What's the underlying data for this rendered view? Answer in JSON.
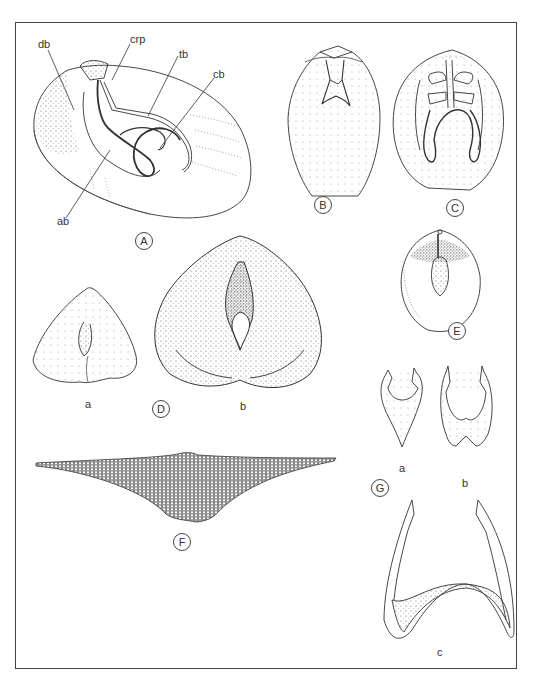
{
  "plate": {
    "figures": [
      {
        "id": "A",
        "label": "A",
        "annotations": [
          "db",
          "crp",
          "tb",
          "cb",
          "ab"
        ]
      },
      {
        "id": "B",
        "label": "B"
      },
      {
        "id": "C",
        "label": "C"
      },
      {
        "id": "D",
        "label": "D",
        "parts": [
          "a",
          "b"
        ]
      },
      {
        "id": "E",
        "label": "E"
      },
      {
        "id": "F",
        "label": "F"
      },
      {
        "id": "G",
        "label": "G",
        "parts": [
          "a",
          "b",
          "c"
        ]
      }
    ]
  },
  "colors": {
    "ink": "#333333",
    "border": "#444444",
    "background": "#ffffff"
  }
}
